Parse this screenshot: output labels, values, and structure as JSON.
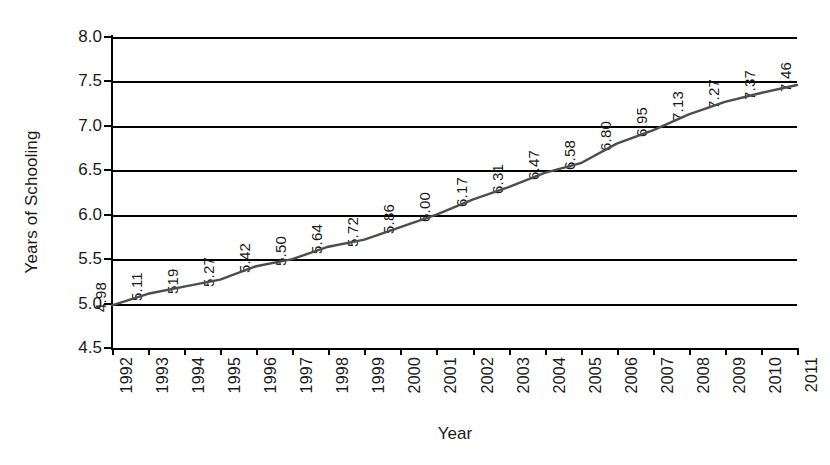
{
  "chart_data": {
    "type": "line",
    "title": "",
    "xlabel": "Year",
    "ylabel": "Years of Schooling",
    "categories": [
      "1992",
      "1993",
      "1994",
      "1995",
      "1996",
      "1997",
      "1998",
      "1999",
      "2000",
      "2001",
      "2002",
      "2003",
      "2004",
      "2005",
      "2006",
      "2007",
      "2008",
      "2009",
      "2010",
      "2011"
    ],
    "values": [
      4.98,
      5.11,
      5.19,
      5.27,
      5.42,
      5.5,
      5.64,
      5.72,
      5.86,
      6.0,
      6.17,
      6.31,
      6.47,
      6.58,
      6.8,
      6.95,
      7.13,
      7.27,
      7.37,
      7.46
    ],
    "point_labels": [
      "4.98",
      "5.11",
      "519",
      "5.27",
      "5.42",
      "5.50",
      "5.64",
      "5.72",
      "5.86",
      "6.00",
      "6.17",
      "6.31",
      "6.47",
      "6.58",
      "6.80",
      "6.95",
      "7.13",
      "7.27",
      "7.37",
      "7.46"
    ],
    "ylim": [
      4.5,
      8.0
    ],
    "y_ticks": [
      "8.0",
      "7.5",
      "7.0",
      "6.5",
      "6.0",
      "5.5",
      "5.0",
      "4.5"
    ],
    "y_tick_values": [
      8.0,
      7.5,
      7.0,
      6.5,
      6.0,
      5.5,
      5.0,
      4.5
    ],
    "grid": true,
    "legend": "none",
    "series_name": "Years of Schooling",
    "line_color": "#4d4d4d",
    "axis_color": "#000000"
  }
}
